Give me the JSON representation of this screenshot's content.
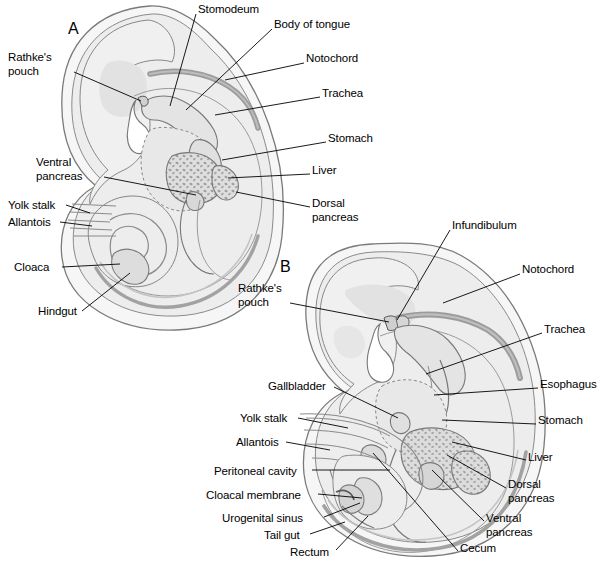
{
  "figure": {
    "width": 601,
    "height": 564,
    "background": "#ffffff"
  },
  "colors": {
    "outline": "#6b6b6b",
    "ink": "#000000",
    "amnion_fill": "#f4f4f4",
    "body_fill": "#ebebeb",
    "inner_fill": "#e2e2e2",
    "gut_fill": "#dddddd",
    "notochord": "#9a9a9a",
    "liver_fill": "#d6d6d6",
    "leader": "#000000"
  },
  "panels": [
    {
      "id": "A",
      "letter": "A",
      "letter_pos": {
        "x": 68,
        "y": 20
      },
      "labels": [
        {
          "name": "stomodeum",
          "text": "Stomodeum",
          "align": "left",
          "x": 198,
          "y": 3,
          "leader": [
            [
              196,
              14
            ],
            [
              170,
              106
            ]
          ]
        },
        {
          "name": "body-of-tongue",
          "text": "Body of tongue",
          "align": "left",
          "x": 274,
          "y": 18,
          "leader": [
            [
              272,
              29
            ],
            [
              186,
              110
            ]
          ]
        },
        {
          "name": "notochord",
          "text": "Notochord",
          "align": "left",
          "x": 306,
          "y": 52,
          "leader": [
            [
              304,
              63
            ],
            [
              225,
              80
            ]
          ]
        },
        {
          "name": "trachea",
          "text": "Trachea",
          "align": "left",
          "x": 322,
          "y": 87,
          "leader": [
            [
              320,
              97
            ],
            [
              215,
              115
            ]
          ]
        },
        {
          "name": "stomach",
          "text": "Stomach",
          "align": "left",
          "x": 328,
          "y": 132,
          "leader": [
            [
              326,
              142
            ],
            [
              222,
              160
            ]
          ]
        },
        {
          "name": "liver",
          "text": "Liver",
          "align": "left",
          "x": 312,
          "y": 164,
          "leader": [
            [
              310,
              174
            ],
            [
              228,
              178
            ]
          ]
        },
        {
          "name": "dorsal-pancreas",
          "text": "Dorsal\npancreas",
          "align": "left",
          "x": 312,
          "y": 197,
          "leader": [
            [
              310,
              207
            ],
            [
              236,
              192
            ]
          ]
        },
        {
          "name": "rathkes-pouch",
          "text": "Rathke's\npouch",
          "align": "left",
          "x": 8,
          "y": 51,
          "leader": [
            [
              74,
              72
            ],
            [
              141,
              101
            ]
          ]
        },
        {
          "name": "ventral-pancreas",
          "text": "Ventral\npancreas",
          "align": "left",
          "x": 36,
          "y": 156,
          "leader": [
            [
              104,
              177
            ],
            [
              196,
              195
            ]
          ]
        },
        {
          "name": "yolk-stalk",
          "text": "Yolk stalk",
          "align": "left",
          "x": 8,
          "y": 199,
          "leader": [
            [
              66,
              205
            ],
            [
              90,
              213
            ]
          ]
        },
        {
          "name": "allantois",
          "text": "Allantois",
          "align": "left",
          "x": 8,
          "y": 216,
          "leader": [
            [
              60,
              222
            ],
            [
              92,
              226
            ]
          ]
        },
        {
          "name": "cloaca",
          "text": "Cloaca",
          "align": "left",
          "x": 14,
          "y": 261,
          "leader": [
            [
              62,
              267
            ],
            [
              120,
              264
            ]
          ]
        },
        {
          "name": "hindgut",
          "text": "Hindgut",
          "align": "left",
          "x": 38,
          "y": 305,
          "leader": [
            [
              82,
              311
            ],
            [
              130,
              273
            ]
          ]
        }
      ]
    },
    {
      "id": "B",
      "letter": "B",
      "letter_pos": {
        "x": 280,
        "y": 258
      },
      "labels": [
        {
          "name": "infundibulum",
          "text": "Infundibulum",
          "align": "left",
          "x": 452,
          "y": 219,
          "leader": [
            [
              450,
              230
            ],
            [
              397,
              320
            ]
          ]
        },
        {
          "name": "notochord",
          "text": "Notochord",
          "align": "left",
          "x": 522,
          "y": 263,
          "leader": [
            [
              520,
              274
            ],
            [
              443,
              303
            ]
          ]
        },
        {
          "name": "trachea",
          "text": "Trachea",
          "align": "left",
          "x": 544,
          "y": 323,
          "leader": [
            [
              542,
              333
            ],
            [
              426,
              374
            ]
          ]
        },
        {
          "name": "esophagus",
          "text": "Esophagus",
          "align": "left",
          "x": 540,
          "y": 378,
          "leader": [
            [
              538,
              388
            ],
            [
              434,
              395
            ]
          ]
        },
        {
          "name": "stomach",
          "text": "Stomach",
          "align": "left",
          "x": 538,
          "y": 414,
          "leader": [
            [
              536,
              424
            ],
            [
              442,
              420
            ]
          ]
        },
        {
          "name": "liver",
          "text": "Liver",
          "align": "left",
          "x": 528,
          "y": 451,
          "leader": [
            [
              526,
              460
            ],
            [
              452,
              442
            ]
          ]
        },
        {
          "name": "dorsal-pancreas",
          "text": "Dorsal\npancreas",
          "align": "left",
          "x": 508,
          "y": 478,
          "leader": [
            [
              506,
              488
            ],
            [
              447,
              455
            ]
          ]
        },
        {
          "name": "ventral-pancreas",
          "text": "Ventral\npancreas",
          "align": "left",
          "x": 486,
          "y": 512,
          "leader": [
            [
              484,
              521
            ],
            [
              432,
              470
            ]
          ]
        },
        {
          "name": "cecum",
          "text": "Cecum",
          "align": "left",
          "x": 460,
          "y": 542,
          "leader": [
            [
              458,
              551
            ],
            [
              373,
              453
            ]
          ]
        },
        {
          "name": "rathkes-pouch",
          "text": "Rathke's\npouch",
          "align": "left",
          "x": 238,
          "y": 282,
          "leader": [
            [
              290,
              303
            ],
            [
              389,
              322
            ]
          ]
        },
        {
          "name": "gallbladder",
          "text": "Gallbladder",
          "align": "left",
          "x": 268,
          "y": 380,
          "leader": [
            [
              334,
              387
            ],
            [
              398,
              418
            ]
          ]
        },
        {
          "name": "yolk-stalk",
          "text": "Yolk stalk",
          "align": "left",
          "x": 240,
          "y": 412,
          "leader": [
            [
              298,
              418
            ],
            [
              348,
              428
            ]
          ]
        },
        {
          "name": "allantois",
          "text": "Allantois",
          "align": "left",
          "x": 236,
          "y": 436,
          "leader": [
            [
              286,
              442
            ],
            [
              330,
              450
            ]
          ]
        },
        {
          "name": "peritoneal-cavity",
          "text": "Peritoneal cavity",
          "align": "left",
          "x": 214,
          "y": 465,
          "leader": [
            [
              312,
              470
            ],
            [
              390,
              470
            ]
          ]
        },
        {
          "name": "cloacal-membrane",
          "text": "Cloacal membrane",
          "align": "left",
          "x": 206,
          "y": 489,
          "leader": [
            [
              318,
              494
            ],
            [
              362,
              498
            ]
          ]
        },
        {
          "name": "urogenital-sinus",
          "text": "Urogenital sinus",
          "align": "left",
          "x": 222,
          "y": 512,
          "leader": [
            [
              324,
              517
            ],
            [
              360,
              503
            ]
          ]
        },
        {
          "name": "tail-gut",
          "text": "Tail gut",
          "align": "left",
          "x": 264,
          "y": 529,
          "leader": [
            [
              310,
              534
            ],
            [
              345,
              522
            ]
          ]
        },
        {
          "name": "rectum",
          "text": "Rectum",
          "align": "left",
          "x": 290,
          "y": 546,
          "leader": [
            [
              336,
              550
            ],
            [
              368,
              516
            ]
          ]
        }
      ]
    }
  ]
}
